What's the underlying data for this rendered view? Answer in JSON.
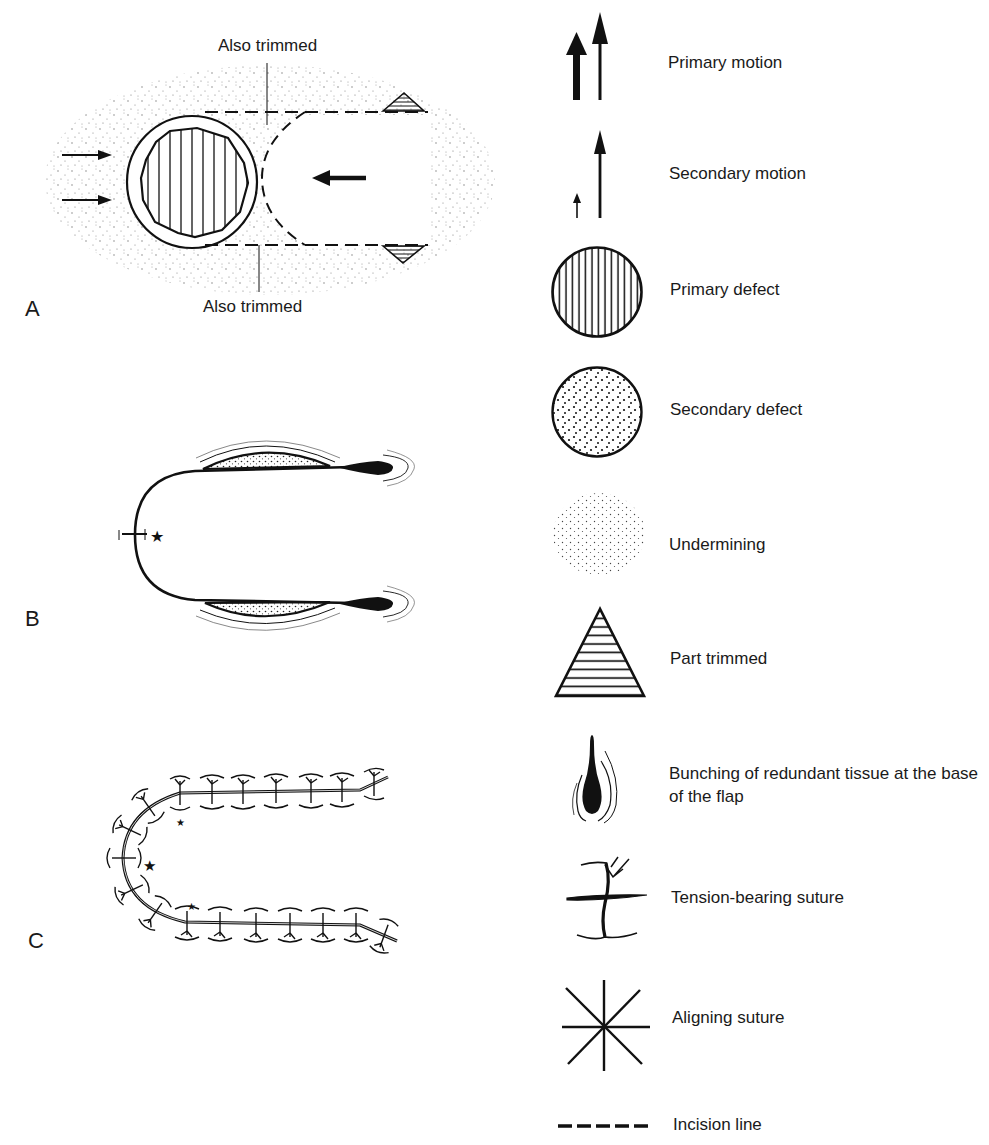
{
  "figure": {
    "panels": [
      {
        "letter": "A",
        "callouts": [
          "Also trimmed",
          "Also trimmed"
        ]
      },
      {
        "letter": "B"
      },
      {
        "letter": "C"
      }
    ],
    "legend": [
      {
        "icon": "primary-motion-arrows-icon",
        "label": "Primary motion"
      },
      {
        "icon": "secondary-motion-arrows-icon",
        "label": "Secondary motion"
      },
      {
        "icon": "primary-defect-hatched-circle-icon",
        "label": "Primary defect"
      },
      {
        "icon": "secondary-defect-dotted-circle-icon",
        "label": "Secondary defect"
      },
      {
        "icon": "undermining-stipple-icon",
        "label": "Undermining"
      },
      {
        "icon": "part-trimmed-triangle-icon",
        "label": "Part trimmed"
      },
      {
        "icon": "tissue-bunching-icon",
        "label": "Bunching of redundant tissue at the base of the flap"
      },
      {
        "icon": "tension-suture-icon",
        "label": "Tension-bearing suture"
      },
      {
        "icon": "aligning-suture-icon",
        "label": "Aligning suture"
      },
      {
        "icon": "incision-line-icon",
        "label": "Incision line"
      }
    ]
  }
}
